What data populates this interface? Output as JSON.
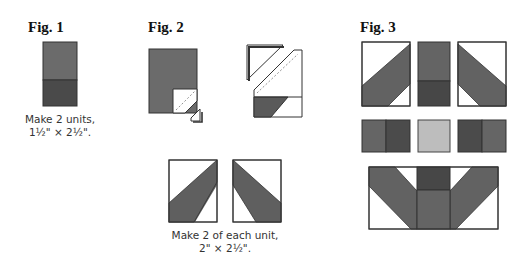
{
  "figures": {
    "fig1": {
      "title": "Fig. 1",
      "caption_line1": "Make 2 units,",
      "caption_line2": "1½\" × 2½\"."
    },
    "fig2": {
      "title": "Fig. 2",
      "caption_line1": "Make 2 of each unit,",
      "caption_line2": "2\" × 2½\"."
    },
    "fig3": {
      "title": "Fig. 3"
    }
  },
  "colors": {
    "medium_gray": "#6b6b6b",
    "dark_gray": "#4a4a4a",
    "light_gray": "#bdbdbd",
    "white": "#ffffff",
    "outline": "#333333"
  }
}
